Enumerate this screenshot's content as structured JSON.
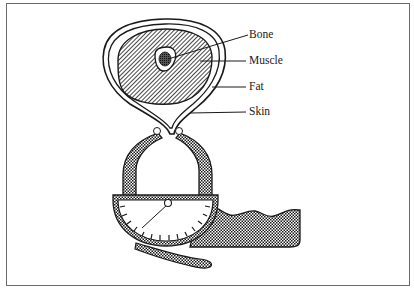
{
  "figure": {
    "labels": [
      {
        "id": "bone",
        "text": "Bone",
        "x": 249,
        "y": 29
      },
      {
        "id": "muscle",
        "text": "Muscle",
        "x": 249,
        "y": 55
      },
      {
        "id": "fat",
        "text": "Fat",
        "x": 249,
        "y": 81
      },
      {
        "id": "skin",
        "text": "Skin",
        "x": 249,
        "y": 106
      }
    ],
    "parts": [
      "cross-section",
      "bone",
      "muscle",
      "fat-layer",
      "skin-layer",
      "skinfold-pinch",
      "caliper-jaws",
      "caliper-dial",
      "dial-needle",
      "caliper-handle",
      "caliper-lever"
    ],
    "colors": {
      "ink": "#1a1a1a",
      "frame": "#6b6b6b",
      "background": "#ffffff"
    }
  }
}
